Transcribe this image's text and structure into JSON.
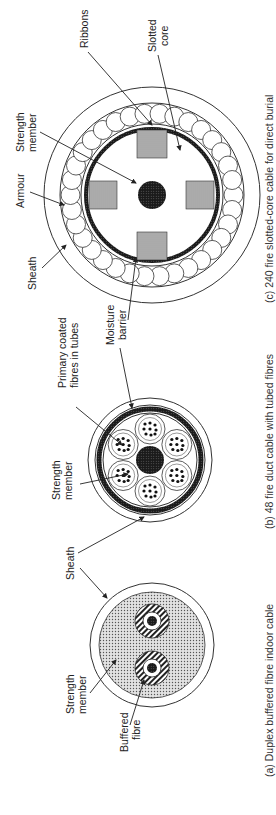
{
  "figure": {
    "orientation": "rotated-90-ccw",
    "panels": [
      {
        "id": "a",
        "caption": "(a) Duplex buffered fibre indoor cable",
        "labels": {
          "sheath": "Sheath",
          "strength_member": [
            "Strength",
            "member"
          ],
          "buffered_fibre": [
            "Buffered",
            "fibre"
          ]
        }
      },
      {
        "id": "b",
        "caption": "(b) 48 fire duct cable with tubed fibres",
        "labels": {
          "strength_member": [
            "Strength",
            "member"
          ],
          "primary_coated": [
            "Primary coated",
            "fibres in tubes"
          ],
          "moisture_barrier": [
            "Moisture",
            "barrier"
          ]
        }
      },
      {
        "id": "c",
        "caption": "(c) 240 fire slotted-core cable for direct burial",
        "labels": {
          "sheath": "Sheath",
          "armour": "Armour",
          "strength_member": [
            "Strength",
            "member"
          ],
          "ribbons": "Ribbons",
          "slotted_core": [
            "Slotted",
            "core"
          ]
        }
      }
    ]
  }
}
